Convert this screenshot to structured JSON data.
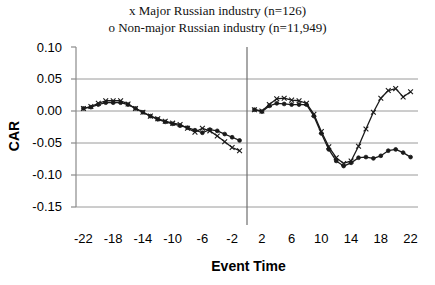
{
  "chart_data": {
    "type": "line",
    "title": "",
    "xlabel": "Event Time",
    "ylabel": "CAR",
    "legend": {
      "position": "top-center",
      "entries": [
        {
          "marker": "x",
          "label": "x Major Russian industry (n=126)"
        },
        {
          "marker": "o",
          "label": "o Non-major Russian industry (n=11,949)"
        }
      ]
    },
    "xlim": [
      -23,
      23
    ],
    "ylim": [
      -0.15,
      0.1
    ],
    "xticks": [
      -22,
      -18,
      -14,
      -10,
      -6,
      -2,
      2,
      6,
      10,
      14,
      18,
      22
    ],
    "xtick_labels": [
      "-22",
      "-18",
      "-14",
      "-10",
      "-6",
      "-2",
      "2",
      "6",
      "10",
      "14",
      "18",
      "22"
    ],
    "yticks": [
      0.1,
      0.05,
      0.0,
      -0.05,
      -0.1,
      -0.15
    ],
    "ytick_labels": [
      "0.10",
      "0.05",
      "0.00",
      "-0.05",
      "-0.10",
      "-0.15"
    ],
    "grid": "horizontal",
    "event_line_x": 0,
    "x": [
      -22,
      -21,
      -20,
      -19,
      -18,
      -17,
      -16,
      -15,
      -14,
      -13,
      -12,
      -11,
      -10,
      -9,
      -8,
      -7,
      -6,
      -5,
      -4,
      -3,
      -2,
      -1,
      1,
      2,
      3,
      4,
      5,
      6,
      7,
      8,
      9,
      10,
      11,
      12,
      13,
      14,
      15,
      16,
      17,
      18,
      19,
      20,
      21,
      22
    ],
    "series": [
      {
        "name": "Major Russian industry (n=126)",
        "marker": "x",
        "color": "#1a1a1a",
        "values": [
          0.004,
          0.007,
          0.012,
          0.016,
          0.016,
          0.016,
          0.011,
          0.004,
          -0.002,
          -0.008,
          -0.012,
          -0.016,
          -0.019,
          -0.021,
          -0.027,
          -0.033,
          -0.027,
          -0.031,
          -0.039,
          -0.048,
          -0.057,
          -0.062,
          -0.07,
          -0.082,
          -0.09,
          -0.096,
          -0.103,
          -0.11,
          -0.113,
          -0.118,
          -0.121,
          -0.125,
          -0.122,
          -0.128,
          -0.13,
          -0.132,
          -0.129,
          -0.131,
          -0.13,
          -0.129,
          -0.128,
          -0.127,
          -0.128,
          -0.13
        ]
      },
      {
        "name": "Non-major Russian industry (n=11,949)",
        "marker": "o",
        "color": "#1a1a1a",
        "values": [
          0.004,
          0.006,
          0.01,
          0.013,
          0.013,
          0.013,
          0.01,
          0.004,
          -0.002,
          -0.008,
          -0.013,
          -0.017,
          -0.02,
          -0.023,
          -0.026,
          -0.03,
          -0.034,
          -0.029,
          -0.031,
          -0.036,
          -0.041,
          -0.046,
          -0.052,
          -0.056,
          -0.057,
          -0.06,
          -0.063,
          -0.07,
          -0.072,
          -0.074,
          -0.073,
          -0.069,
          -0.071,
          -0.072,
          -0.073,
          -0.078,
          -0.079,
          -0.081,
          -0.08,
          -0.079,
          -0.08,
          -0.081,
          -0.079,
          -0.08
        ]
      }
    ],
    "post_event_x": [
      1,
      2,
      3,
      4,
      5,
      6,
      7,
      8,
      9,
      10,
      11,
      12,
      13,
      14,
      15,
      16,
      17,
      18,
      19,
      20,
      21,
      22
    ],
    "post_event_series": [
      {
        "name": "Major Russian industry (n=126) post-event",
        "marker": "x",
        "color": "#1a1a1a",
        "values": [
          0.002,
          0.0,
          0.01,
          0.019,
          0.02,
          0.017,
          0.016,
          0.012,
          -0.005,
          -0.032,
          -0.056,
          -0.073,
          -0.082,
          -0.078,
          -0.055,
          -0.028,
          -0.002,
          0.02,
          0.032,
          0.035,
          0.022,
          0.03
        ]
      },
      {
        "name": "Non-major Russian industry (n=11,949) post-event",
        "marker": "o",
        "color": "#1a1a1a",
        "values": [
          0.002,
          -0.001,
          0.008,
          0.012,
          0.011,
          0.01,
          0.01,
          0.01,
          -0.008,
          -0.035,
          -0.06,
          -0.078,
          -0.086,
          -0.081,
          -0.073,
          -0.072,
          -0.074,
          -0.07,
          -0.062,
          -0.06,
          -0.065,
          -0.072
        ]
      }
    ]
  }
}
